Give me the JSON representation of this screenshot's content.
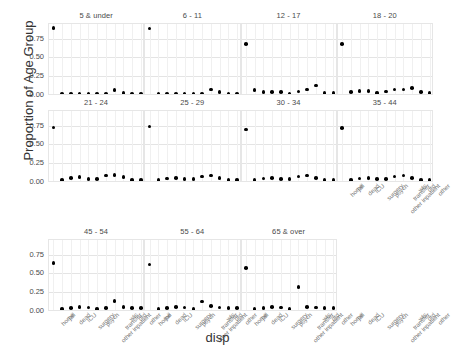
{
  "chart_data": {
    "type": "scatter",
    "title": "",
    "xlabel": "disp",
    "ylabel": "Proportion of Age Group",
    "ylim": [
      -0.02,
      0.95
    ],
    "yticks": [
      "0.00",
      "0.25",
      "0.50",
      "0.75"
    ],
    "ytick_values": [
      0.0,
      0.25,
      0.5,
      0.75
    ],
    "grid": true,
    "legend": "none",
    "facet_variable": "age group",
    "categories": [
      "home",
      "jail",
      "dead",
      "ICU",
      "surgery",
      "psych",
      "other inpatient",
      "transfer",
      "wls",
      "dtd",
      "other"
    ],
    "panels": [
      {
        "label": "5 & under",
        "values": [
          0.9,
          0.01,
          0.01,
          0.01,
          0.01,
          0.01,
          0.01,
          0.06,
          0.02,
          0.01,
          0.01
        ]
      },
      {
        "label": "6 - 11",
        "values": [
          0.89,
          0.01,
          0.01,
          0.01,
          0.01,
          0.01,
          0.01,
          0.07,
          0.03,
          0.01,
          0.01
        ]
      },
      {
        "label": "12 - 17",
        "values": [
          0.68,
          0.06,
          0.03,
          0.03,
          0.03,
          0.01,
          0.04,
          0.07,
          0.12,
          0.02,
          0.02
        ]
      },
      {
        "label": "18 - 20",
        "values": [
          0.68,
          0.03,
          0.05,
          0.05,
          0.02,
          0.04,
          0.07,
          0.07,
          0.09,
          0.03,
          0.02
        ]
      },
      {
        "label": "21 - 24",
        "values": [
          0.73,
          0.02,
          0.05,
          0.06,
          0.03,
          0.03,
          0.08,
          0.09,
          0.06,
          0.02,
          0.02
        ]
      },
      {
        "label": "25 - 29",
        "values": [
          0.74,
          0.02,
          0.04,
          0.05,
          0.03,
          0.03,
          0.07,
          0.08,
          0.05,
          0.02,
          0.02
        ]
      },
      {
        "label": "30 - 34",
        "values": [
          0.7,
          0.02,
          0.04,
          0.05,
          0.03,
          0.03,
          0.07,
          0.08,
          0.05,
          0.02,
          0.02
        ]
      },
      {
        "label": "35 - 44",
        "values": [
          0.72,
          0.02,
          0.04,
          0.05,
          0.03,
          0.03,
          0.07,
          0.08,
          0.05,
          0.02,
          0.02
        ]
      },
      {
        "label": "45 - 54",
        "values": [
          0.64,
          0.02,
          0.03,
          0.05,
          0.04,
          0.02,
          0.03,
          0.13,
          0.05,
          0.03,
          0.03
        ]
      },
      {
        "label": "55 - 64",
        "values": [
          0.62,
          0.02,
          0.03,
          0.05,
          0.04,
          0.02,
          0.12,
          0.06,
          0.04,
          0.03,
          0.03
        ]
      },
      {
        "label": "65 & over",
        "values": [
          0.57,
          0.02,
          0.03,
          0.05,
          0.04,
          0.02,
          0.32,
          0.05,
          0.04,
          0.03,
          0.03
        ]
      }
    ]
  }
}
